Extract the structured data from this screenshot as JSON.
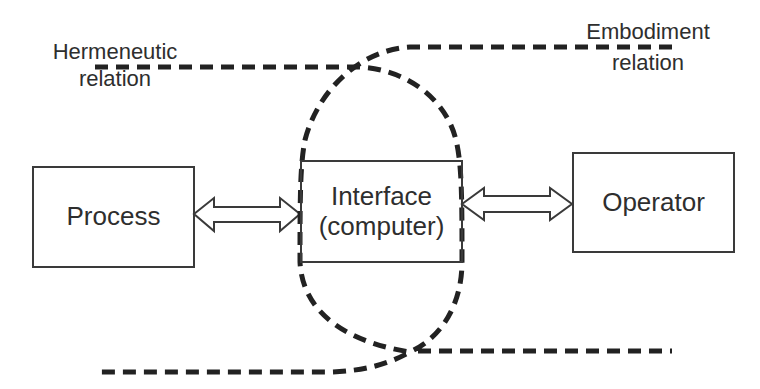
{
  "diagram": {
    "type": "block diagram with dashed relation curves",
    "colors": {
      "background": "#ffffff",
      "stroke": "#2a2a2a",
      "text": "#2e2e2e"
    },
    "labels": {
      "hermeneutic": {
        "line1": "Hermeneutic",
        "line2": "relation"
      },
      "embodiment": {
        "line1": "Embodiment",
        "line2": "relation"
      }
    },
    "boxes": [
      {
        "id": "process",
        "lines": [
          "Process"
        ]
      },
      {
        "id": "interface",
        "lines": [
          "Interface",
          "(computer)"
        ]
      },
      {
        "id": "operator",
        "lines": [
          "Operator"
        ]
      }
    ],
    "arrows": [
      {
        "from": "process",
        "to": "interface",
        "style": "hollow double-headed"
      },
      {
        "from": "interface",
        "to": "operator",
        "style": "hollow double-headed"
      }
    ],
    "curves": [
      {
        "name": "hermeneutic-relation-curve",
        "style": "dashed",
        "description": "enters top-left, wraps right side of Interface, exits bottom-right"
      },
      {
        "name": "embodiment-relation-curve",
        "style": "dashed",
        "description": "enters top-right, wraps left side of Interface, exits bottom-left"
      }
    ]
  }
}
